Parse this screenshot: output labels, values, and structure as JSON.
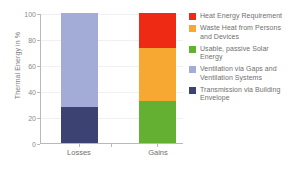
{
  "chart_data": {
    "type": "bar",
    "title": "",
    "xlabel": "",
    "ylabel": "Thermal Energy in %",
    "categories": [
      "Losses",
      "Gains"
    ],
    "ylim": [
      0,
      100
    ],
    "yticks": [
      0,
      20,
      40,
      60,
      80,
      100
    ],
    "grid": true,
    "stacked": true,
    "legend_position": "right",
    "series": [
      {
        "name": "Heat Energy Requirement",
        "color": "#ef2a14",
        "values": [
          0,
          27
        ]
      },
      {
        "name": "Waste Heat from Persons and Devices",
        "color": "#f7a833",
        "values": [
          0,
          41
        ]
      },
      {
        "name": "Usable, passive Solar Energy",
        "color": "#64b032",
        "values": [
          0,
          32
        ]
      },
      {
        "name": "Ventilation via Gaps and Ventilation Systems",
        "color": "#a3acd6",
        "values": [
          72,
          0
        ]
      },
      {
        "name": "Transmission via Building Envelope",
        "color": "#3c4272",
        "values": [
          28,
          0
        ]
      }
    ]
  },
  "axis": {
    "y_title": "Thermal Energy in %",
    "y_tick_labels": [
      "100",
      "80",
      "60",
      "40",
      "20",
      "0"
    ],
    "x_tick_labels": [
      "Losses",
      "Gains"
    ]
  },
  "legend": {
    "items": [
      {
        "label": "Heat Energy Requirement",
        "color": "#ef2a14"
      },
      {
        "label": "Waste Heat from Persons and Devices",
        "color": "#f7a833"
      },
      {
        "label": "Usable, passive Solar Energy",
        "color": "#64b032"
      },
      {
        "label": "Ventilation via Gaps and Ventilation Systems",
        "color": "#a3acd6"
      },
      {
        "label": "Transmission via Building Envelope",
        "color": "#3c4272"
      }
    ]
  },
  "bars": {
    "losses": {
      "label": "Losses",
      "segments": [
        {
          "name": "Ventilation via Gaps and Ventilation Systems",
          "value": 72,
          "color": "#a3acd6"
        },
        {
          "name": "Transmission via Building Envelope",
          "value": 28,
          "color": "#3c4272"
        }
      ]
    },
    "gains": {
      "label": "Gains",
      "segments": [
        {
          "name": "Heat Energy Requirement",
          "value": 27,
          "color": "#ef2a14"
        },
        {
          "name": "Waste Heat from Persons and Devices",
          "value": 41,
          "color": "#f7a833"
        },
        {
          "name": "Usable, passive Solar Energy",
          "value": 32,
          "color": "#64b032"
        }
      ]
    }
  }
}
